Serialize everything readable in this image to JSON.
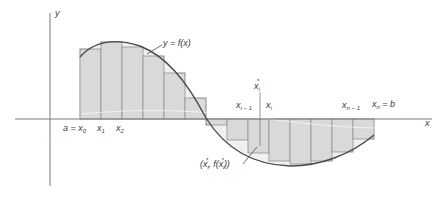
{
  "figure": {
    "axes": {
      "x_label": "x",
      "y_label": "y",
      "origin_px": [
        50,
        119
      ]
    },
    "curve": {
      "label": "y = f(x)"
    },
    "partition_labels": {
      "a_x0": "a = x",
      "a_x0_sub": "0",
      "x1": "x",
      "x1_sub": "1",
      "x2": "x",
      "x2_sub": "2",
      "xi_minus_1": "x",
      "xi_minus_1_sub": "i − 1",
      "xi": "x",
      "xi_sub": "i",
      "xn_minus_1": "x",
      "xn_minus_1_sub": "n − 1",
      "xn_b": "x",
      "xn_b_sub": "n",
      "xn_b_suffix": " = b",
      "xi_star": "x",
      "xi_star_sub": "i",
      "xi_star_sup": "*"
    },
    "sample_point_label": {
      "open": "(x",
      "sub1": "i",
      "sup1": "*",
      "mid": ", f(x",
      "sub2": "i",
      "sup2": "*",
      "close": "))"
    },
    "colors": {
      "fill": "#dcdcdc",
      "rect_stroke": "#6e6e6e",
      "curve": "#4a4a4a",
      "axis": "#7a7a7a",
      "text": "#3a3a3a"
    },
    "rectangles": {
      "count": 14,
      "edges_px": [
        80,
        101,
        122,
        143,
        164,
        185,
        206,
        227,
        248,
        269,
        290,
        311,
        332,
        353,
        374
      ],
      "tops_px": [
        49,
        42,
        47,
        56,
        73,
        98,
        116,
        126,
        140,
        153,
        161,
        164,
        163,
        152
      ]
    }
  }
}
